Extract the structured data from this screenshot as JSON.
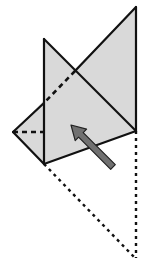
{
  "diagram": {
    "colors": {
      "paper_fill": "#d9d9d9",
      "outline": "#111111",
      "arrow_fill": "#707070",
      "arrow_stroke": "#222222",
      "background": "#ffffff"
    },
    "shapes": {
      "folded_flap": "136,7 136,131 44,164 13,132",
      "front_panel": "44,39 136,131 44,164"
    },
    "lines": {
      "solid": [
        {
          "name": "top-right-vertical-edge",
          "x1": 136,
          "y1": 7,
          "x2": 136,
          "y2": 131
        },
        {
          "name": "long-diagonal-upper",
          "x1": 136,
          "y1": 7,
          "x2": 75,
          "y2": 71
        },
        {
          "name": "left-upper-edge",
          "x1": 44,
          "y1": 103,
          "x2": 13,
          "y2": 132
        },
        {
          "name": "left-lower-edge",
          "x1": 13,
          "y1": 132,
          "x2": 44,
          "y2": 164
        },
        {
          "name": "bottom-edge",
          "x1": 44,
          "y1": 164,
          "x2": 136,
          "y2": 131
        },
        {
          "name": "panel-vertical-edge",
          "x1": 44,
          "y1": 39,
          "x2": 44,
          "y2": 164
        },
        {
          "name": "panel-diagonal-edge",
          "x1": 44,
          "y1": 39,
          "x2": 136,
          "y2": 131
        }
      ],
      "dashed": [
        {
          "name": "hidden-diagonal",
          "x1": 75,
          "y1": 71,
          "x2": 44,
          "y2": 103
        },
        {
          "name": "hidden-horizontal",
          "x1": 13,
          "y1": 132,
          "x2": 44,
          "y2": 132
        }
      ],
      "dotted": [
        {
          "name": "dotted-diagonal-guide",
          "x1": 44,
          "y1": 164,
          "x2": 135,
          "y2": 258
        },
        {
          "name": "dotted-vertical-guide",
          "x1": 136,
          "y1": 131,
          "x2": 136,
          "y2": 258
        }
      ]
    },
    "arrow": {
      "direction": "up-left",
      "from": [
        113,
        167
      ],
      "to": [
        71,
        125
      ]
    }
  }
}
